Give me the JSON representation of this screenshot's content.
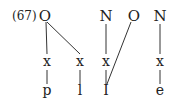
{
  "example_number": "(67)",
  "nodes": {
    "o1": "O",
    "n1": "N",
    "o2": "O",
    "n2": "N",
    "x1": "x",
    "x2": "x",
    "x3": "x",
    "x4": "x",
    "s1": "p",
    "s2": "l",
    "s3": "I",
    "s4": "e"
  }
}
